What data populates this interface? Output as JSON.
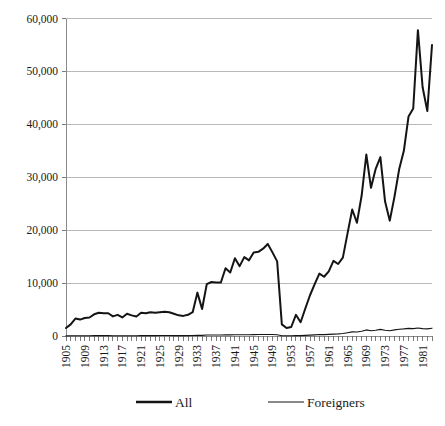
{
  "chart_data": {
    "type": "line",
    "title": "",
    "subtitle": "",
    "xlabel": "",
    "ylabel": "",
    "xlim": [
      1905,
      1983
    ],
    "ylim": [
      0,
      60000
    ],
    "y_ticks": [
      0,
      10000,
      20000,
      30000,
      40000,
      50000,
      60000
    ],
    "y_tick_labels": [
      "0",
      "10,000",
      "20,000",
      "30,000",
      "40,000",
      "50,000",
      "60,000"
    ],
    "x_tick_labels": [
      "1905",
      "1909",
      "1913",
      "1917",
      "1921",
      "1925",
      "1929",
      "1933",
      "1937",
      "1941",
      "1945",
      "1949",
      "1953",
      "1957",
      "1961",
      "1965",
      "1969",
      "1973",
      "1977",
      "1981"
    ],
    "x_tick_step": 4,
    "minor_tick_step": 1,
    "grid": "horizontal",
    "legend_position": "bottom",
    "x": [
      1905,
      1906,
      1907,
      1908,
      1909,
      1910,
      1911,
      1912,
      1913,
      1914,
      1915,
      1916,
      1917,
      1918,
      1919,
      1920,
      1921,
      1922,
      1923,
      1924,
      1925,
      1926,
      1927,
      1928,
      1929,
      1930,
      1931,
      1932,
      1933,
      1934,
      1935,
      1936,
      1937,
      1938,
      1939,
      1940,
      1941,
      1942,
      1943,
      1944,
      1945,
      1946,
      1947,
      1948,
      1949,
      1950,
      1951,
      1952,
      1953,
      1954,
      1955,
      1956,
      1957,
      1958,
      1959,
      1960,
      1961,
      1962,
      1963,
      1964,
      1965,
      1966,
      1967,
      1968,
      1969,
      1970,
      1971,
      1972,
      1973,
      1974,
      1975,
      1976,
      1977,
      1978,
      1979,
      1980,
      1981,
      1982,
      1983
    ],
    "series": [
      {
        "name": "All",
        "color": "#141414",
        "line_width": 2.0,
        "values": [
          1500,
          2200,
          3300,
          3100,
          3400,
          3500,
          4100,
          4400,
          4300,
          4300,
          3700,
          4000,
          3500,
          4200,
          3900,
          3700,
          4400,
          4300,
          4500,
          4400,
          4500,
          4600,
          4500,
          4200,
          3900,
          3800,
          4000,
          4500,
          8200,
          5100,
          9800,
          10200,
          10100,
          10100,
          12800,
          12000,
          14700,
          13200,
          14900,
          14300,
          15800,
          15900,
          16500,
          17400,
          15800,
          14100,
          2200,
          1500,
          1700,
          4000,
          2600,
          5200,
          7700,
          9800,
          11800,
          11200,
          12200,
          14200,
          13600,
          14800,
          19400,
          23900,
          21400,
          26500,
          34300,
          28000,
          31600,
          33800,
          25400,
          21800,
          26300,
          31500,
          35000,
          41500,
          43000,
          57800,
          47000,
          42500,
          55000
        ]
      },
      {
        "name": "Foreigners",
        "color": "#141414",
        "line_width": 1.1,
        "values": [
          30,
          40,
          50,
          50,
          60,
          60,
          70,
          80,
          80,
          70,
          60,
          60,
          50,
          60,
          60,
          60,
          70,
          70,
          80,
          80,
          90,
          90,
          90,
          80,
          80,
          80,
          80,
          90,
          150,
          120,
          180,
          190,
          190,
          190,
          220,
          210,
          250,
          230,
          250,
          240,
          260,
          270,
          280,
          290,
          270,
          250,
          60,
          50,
          60,
          90,
          80,
          120,
          170,
          220,
          270,
          260,
          300,
          360,
          400,
          470,
          620,
          780,
          760,
          900,
          1150,
          1000,
          1100,
          1250,
          1080,
          1000,
          1150,
          1280,
          1350,
          1450,
          1400,
          1500,
          1400,
          1350,
          1480
        ]
      }
    ],
    "legend": [
      {
        "label": "All",
        "style": "thick"
      },
      {
        "label": "Foreigners",
        "style": "thin"
      }
    ]
  },
  "colors": {
    "background": "#ffffff",
    "gridline": "#a6a6a6",
    "axis": "#8c8c8c",
    "series": "#141414",
    "text": "#1a1a1a"
  }
}
